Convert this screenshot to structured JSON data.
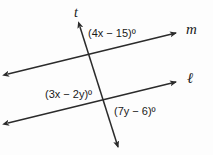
{
  "figure": {
    "background_color": "#fdfdfd",
    "stroke_color": "#2b2b2b",
    "text_color": "#1a1a1a"
  },
  "lines": [
    {
      "id": "transversal",
      "label": "t",
      "description": "transversal line crossing both parallel lines",
      "arrowheads": "both",
      "start": [
        80,
        27
      ],
      "end": [
        118,
        147
      ]
    },
    {
      "id": "line-m",
      "label": "m",
      "description": "upper parallel line",
      "arrowheads": "both",
      "start": [
        8,
        74
      ],
      "end": [
        176,
        33
      ]
    },
    {
      "id": "line-l",
      "label": "ℓ",
      "description": "lower parallel line",
      "arrowheads": "both",
      "start": [
        8,
        123
      ],
      "end": [
        176,
        82
      ]
    }
  ],
  "intersections": [
    {
      "id": "upper",
      "point": [
        92,
        58
      ],
      "lines": [
        "transversal",
        "line-m"
      ]
    },
    {
      "id": "lower",
      "point": [
        108,
        103
      ],
      "lines": [
        "transversal",
        "line-l"
      ]
    }
  ],
  "angle_labels": [
    {
      "id": "upper-angle",
      "text": "(4x − 15)º",
      "expression": "4x - 15",
      "at_intersection": "upper",
      "position": "above-right"
    },
    {
      "id": "lower-left-angle",
      "text": "(3x − 2y)º",
      "expression": "3x - 2y",
      "at_intersection": "lower",
      "position": "above-left"
    },
    {
      "id": "lower-right-angle",
      "text": "(7y − 6)º",
      "expression": "7y - 6",
      "at_intersection": "lower",
      "position": "below-right"
    }
  ],
  "line_labels": {
    "transversal": "t",
    "upper_line": "m",
    "lower_line": "ℓ"
  }
}
